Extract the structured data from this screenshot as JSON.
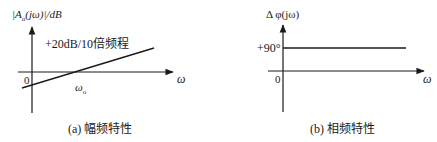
{
  "panels": [
    {
      "id": "a",
      "y_axis_label": "|A",
      "y_axis_label_sub": "u",
      "y_axis_label_rest": "(jω)|/dB",
      "slope_label": "+20dB/10倍频程",
      "x_axis_label": "ω",
      "origin_label": "0",
      "crossing_label": "ω",
      "crossing_label_sub": "o",
      "caption": "(a) 幅频特性"
    },
    {
      "id": "b",
      "y_axis_label": "Δ φ(jω)",
      "level_label": "+90°",
      "x_axis_label": "ω",
      "origin_label": "0",
      "caption": "(b) 相频特性"
    }
  ],
  "colors": {
    "line": "#1a1a1a",
    "background": "#ffffff"
  }
}
